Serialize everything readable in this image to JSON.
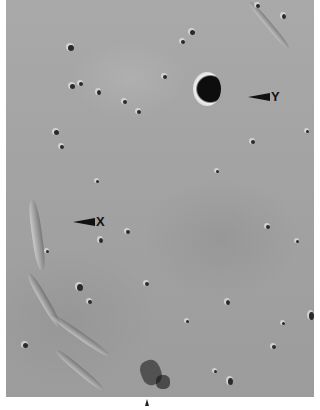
{
  "image": {
    "description": "Grayscale orbital photograph of a lunar mare surface with scattered small craters, a prominent dark-floored crater, and sinuous ridges",
    "labels": [
      {
        "id": "Y",
        "text": "Y",
        "target": "prominent crater near top right"
      },
      {
        "id": "X",
        "text": "X",
        "target": "ridge/rille feature on left side"
      }
    ],
    "marker": {
      "type": "arrow",
      "direction": "up"
    },
    "colors": {
      "surface": "#a5a5a5",
      "shadow": "#111111",
      "background": "#ffffff"
    }
  }
}
